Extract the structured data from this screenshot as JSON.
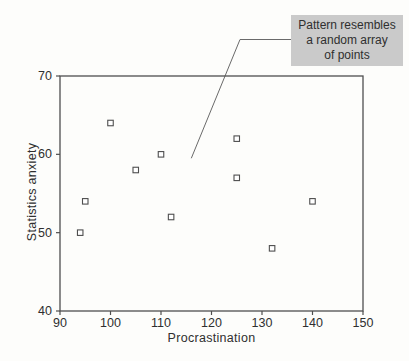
{
  "chart_data": {
    "type": "scatter",
    "title": "",
    "xlabel": "Procrastination",
    "ylabel": "Statistics anxiety",
    "xlim": [
      90,
      150
    ],
    "ylim": [
      40,
      70
    ],
    "x_ticks": [
      90,
      100,
      110,
      120,
      130,
      140,
      150
    ],
    "y_ticks": [
      40,
      50,
      60,
      70
    ],
    "grid": false,
    "legend": "none",
    "marker": "open-square",
    "points": [
      {
        "x": 94,
        "y": 50
      },
      {
        "x": 95,
        "y": 54
      },
      {
        "x": 100,
        "y": 64
      },
      {
        "x": 105,
        "y": 58
      },
      {
        "x": 110,
        "y": 60
      },
      {
        "x": 112,
        "y": 52
      },
      {
        "x": 125,
        "y": 62
      },
      {
        "x": 125,
        "y": 57
      },
      {
        "x": 132,
        "y": 48
      },
      {
        "x": 140,
        "y": 54
      }
    ],
    "annotation": {
      "text": "Pattern resembles a random array of points",
      "lines": [
        "Pattern resembles",
        "a random array",
        "of points"
      ],
      "target": {
        "x": 116,
        "y": 59.5
      }
    },
    "colors": {
      "axis": "#4f4f4f",
      "tick_text": "#2f2f2f",
      "marker_stroke": "#4f4f4f",
      "marker_fill": "#ffffff",
      "leader_line": "#6a6a6a",
      "annotation_bg": "#cacaca",
      "annotation_text": "#2f2f2f",
      "background": "#fdfdfb"
    }
  }
}
